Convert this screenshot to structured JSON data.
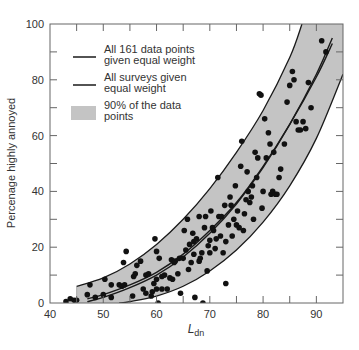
{
  "chart_data": {
    "type": "scatter",
    "title": "",
    "xlabel": "L_dn",
    "xlabel_main": "L",
    "xlabel_sub": "dn",
    "ylabel": "Percenage highly annoyed",
    "xlim": [
      40,
      95
    ],
    "ylim": [
      0,
      100
    ],
    "x_ticks": [
      40,
      50,
      60,
      70,
      80,
      90
    ],
    "y_ticks": [
      0,
      20,
      40,
      60,
      80,
      100
    ],
    "grid": false,
    "legend_position": "upper-left",
    "legend": [
      {
        "label_line1": "All 161 data points",
        "label_line2": "given equal weight",
        "style": "line"
      },
      {
        "label_line1": "All surveys given",
        "label_line2": "equal weight",
        "style": "line"
      },
      {
        "label_line1": "90% of the data",
        "label_line2": "points",
        "style": "band"
      }
    ],
    "colors": {
      "band": "#c4c4c4",
      "line": "#1a1a1a",
      "points": "#111111",
      "axis": "#666666"
    },
    "series": [
      {
        "name": "All 161 data points given equal weight",
        "type": "curve",
        "x": [
          47,
          50,
          55,
          60,
          65,
          70,
          75,
          80,
          85,
          90,
          93
        ],
        "y": [
          1.5,
          3,
          6.5,
          11,
          17.5,
          26,
          36,
          49,
          64,
          81,
          93
        ]
      },
      {
        "name": "All surveys given equal weight",
        "type": "curve",
        "x": [
          47,
          50,
          55,
          60,
          65,
          70,
          75,
          80,
          85,
          90,
          93
        ],
        "y": [
          0.5,
          2,
          5.5,
          10,
          16.5,
          25,
          35.5,
          48.5,
          64,
          82,
          95
        ]
      },
      {
        "name": "90% of the data points (upper bound)",
        "type": "band-upper",
        "x": [
          45,
          50,
          55,
          60,
          65,
          70,
          75,
          80,
          85,
          87.3
        ],
        "y": [
          6,
          9,
          14,
          21,
          30,
          41,
          54,
          69,
          88,
          100
        ]
      },
      {
        "name": "90% of the data points (lower bound)",
        "type": "band-lower",
        "x": [
          53,
          55,
          60,
          65,
          70,
          75,
          80,
          85,
          90,
          95
        ],
        "y": [
          0,
          0.5,
          2.5,
          6,
          11.5,
          19,
          29,
          42,
          59,
          82
        ]
      },
      {
        "name": "Survey data points",
        "type": "scatter",
        "points": [
          [
            43,
            0.5
          ],
          [
            43.8,
            1.5
          ],
          [
            44.5,
            1
          ],
          [
            45,
            1
          ],
          [
            47,
            3
          ],
          [
            47.5,
            6.5
          ],
          [
            48.5,
            2
          ],
          [
            50,
            3
          ],
          [
            50.3,
            8.5
          ],
          [
            51.5,
            2
          ],
          [
            51.5,
            6.5
          ],
          [
            53,
            6.5
          ],
          [
            53.5,
            6
          ],
          [
            53.8,
            14.5
          ],
          [
            54,
            6.5
          ],
          [
            54.3,
            18.5
          ],
          [
            55.5,
            2.5
          ],
          [
            55.7,
            9.5
          ],
          [
            56,
            10.5
          ],
          [
            56.3,
            13.5
          ],
          [
            57,
            15
          ],
          [
            57.5,
            5
          ],
          [
            58,
            3.5
          ],
          [
            58,
            10
          ],
          [
            58.5,
            10.5
          ],
          [
            59,
            2.5
          ],
          [
            59.2,
            4
          ],
          [
            59.5,
            7
          ],
          [
            59.7,
            23
          ],
          [
            60,
            18.5
          ],
          [
            60,
            8.5
          ],
          [
            60,
            5
          ],
          [
            60.3,
            0
          ],
          [
            60.5,
            16
          ],
          [
            61,
            5
          ],
          [
            61,
            9.5
          ],
          [
            61.5,
            10
          ],
          [
            62,
            5
          ],
          [
            62.5,
            9
          ],
          [
            62.8,
            15.5
          ],
          [
            63,
            8.5
          ],
          [
            63.3,
            14.5
          ],
          [
            63.5,
            15
          ],
          [
            64,
            10.5
          ],
          [
            64.3,
            16
          ],
          [
            64.5,
            3.5
          ],
          [
            65,
            16
          ],
          [
            65.2,
            26
          ],
          [
            65.5,
            19
          ],
          [
            65.8,
            30
          ],
          [
            66,
            12
          ],
          [
            66.2,
            21
          ],
          [
            66.5,
            14.5
          ],
          [
            66.8,
            25
          ],
          [
            67,
            17.5
          ],
          [
            67,
            22
          ],
          [
            67.2,
            2
          ],
          [
            67.5,
            23
          ],
          [
            68,
            15
          ],
          [
            68,
            31
          ],
          [
            68.2,
            16
          ],
          [
            68.5,
            18
          ],
          [
            68.7,
            0
          ],
          [
            69,
            27
          ],
          [
            69.2,
            31
          ],
          [
            69.5,
            11.5
          ],
          [
            69.7,
            20.5
          ],
          [
            70,
            22.5
          ],
          [
            70,
            18
          ],
          [
            70.2,
            33
          ],
          [
            70.5,
            27
          ],
          [
            70.7,
            26
          ],
          [
            71,
            19.5
          ],
          [
            71.2,
            23
          ],
          [
            71.5,
            45
          ],
          [
            71.7,
            31
          ],
          [
            72,
            24
          ],
          [
            72.2,
            31
          ],
          [
            72.5,
            18
          ],
          [
            72.8,
            35
          ],
          [
            73,
            7
          ],
          [
            73,
            22
          ],
          [
            73.5,
            28
          ],
          [
            73.8,
            38
          ],
          [
            74,
            35
          ],
          [
            74.2,
            24
          ],
          [
            74.5,
            30
          ],
          [
            74.8,
            42
          ],
          [
            75,
            28
          ],
          [
            75.2,
            33
          ],
          [
            75.5,
            27
          ],
          [
            75.8,
            49
          ],
          [
            76,
            58
          ],
          [
            76.3,
            26
          ],
          [
            76.5,
            32
          ],
          [
            76.8,
            37
          ],
          [
            77,
            47
          ],
          [
            77.2,
            40
          ],
          [
            77.5,
            36
          ],
          [
            77.8,
            38
          ],
          [
            78,
            42
          ],
          [
            78.2,
            30
          ],
          [
            78.5,
            54
          ],
          [
            78.8,
            45
          ],
          [
            79,
            52
          ],
          [
            79.3,
            75
          ],
          [
            79.6,
            74.5
          ],
          [
            79.8,
            34
          ],
          [
            80,
            40
          ],
          [
            80.3,
            66
          ],
          [
            80.6,
            52
          ],
          [
            81,
            61
          ],
          [
            81.3,
            57
          ],
          [
            81.5,
            39
          ],
          [
            81.8,
            40
          ],
          [
            82,
            54
          ],
          [
            82.3,
            39
          ],
          [
            82.6,
            39
          ],
          [
            83,
            45
          ],
          [
            83.3,
            48
          ],
          [
            84,
            57
          ],
          [
            84.5,
            72
          ],
          [
            85,
            78
          ],
          [
            85.5,
            83
          ],
          [
            85.8,
            80
          ],
          [
            86.2,
            65
          ],
          [
            86.6,
            62
          ],
          [
            87,
            62
          ],
          [
            87.5,
            65
          ],
          [
            88,
            62.5
          ],
          [
            88.5,
            79
          ],
          [
            89,
            70
          ],
          [
            91,
            94
          ],
          [
            91.8,
            90
          ]
        ]
      }
    ]
  }
}
